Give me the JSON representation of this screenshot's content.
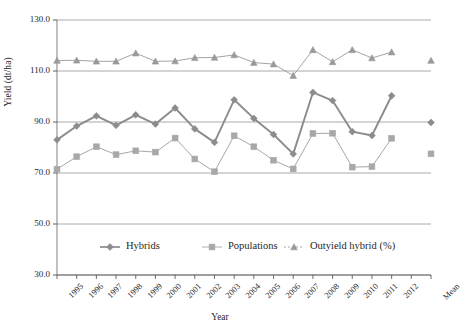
{
  "chart_data": {
    "type": "line",
    "title": "",
    "xlabel": "Year",
    "ylabel": "Yield (dt/ha)",
    "ylim": [
      30.0,
      130.0
    ],
    "ytick_labels": [
      "130.0",
      "110.0",
      "90.0",
      "70.0",
      "50.0",
      "30.0"
    ],
    "ytick_values": [
      130.0,
      110.0,
      90.0,
      70.0,
      50.0,
      30.0
    ],
    "grid": true,
    "legend_position": "bottom-inside",
    "categories": [
      "1995",
      "1996",
      "1997",
      "1998",
      "1999",
      "2000",
      "2001",
      "2002",
      "2003",
      "2004",
      "2005",
      "2006",
      "2007",
      "2008",
      "2009",
      "2010",
      "2011",
      "2012",
      "",
      "Mean"
    ],
    "series": [
      {
        "name": "Hybrids",
        "marker": "diamond",
        "color": "#8c8c8c",
        "values": [
          83.0,
          88.4,
          92.4,
          88.7,
          92.8,
          89.2,
          95.5,
          87.3,
          82.0,
          98.7,
          91.4,
          85.1,
          77.5,
          101.6,
          98.4,
          86.2,
          84.7,
          100.3,
          null,
          89.8
        ]
      },
      {
        "name": "Populations",
        "marker": "square",
        "color": "#a8a8a8",
        "values": [
          71.5,
          76.4,
          80.3,
          77.2,
          78.7,
          78.2,
          83.7,
          75.5,
          70.5,
          84.6,
          80.3,
          75.0,
          71.6,
          85.5,
          85.6,
          72.3,
          72.5,
          83.6,
          null,
          77.5
        ]
      },
      {
        "name": "Outyield hybrid (%)",
        "marker": "triangle",
        "color": "#9a9a9a",
        "values": [
          114.1,
          114.2,
          113.8,
          113.8,
          117.0,
          113.8,
          113.9,
          115.2,
          115.3,
          116.3,
          113.3,
          112.7,
          108.2,
          118.3,
          113.6,
          118.3,
          115.1,
          117.4,
          null,
          114.1
        ]
      }
    ]
  },
  "legend": {
    "items": [
      {
        "label": "Hybrids",
        "marker": "diamond",
        "color": "#8c8c8c"
      },
      {
        "label": "Populations",
        "marker": "square",
        "color": "#a8a8a8"
      },
      {
        "label": "Outyield hybrid (%)",
        "marker": "triangle",
        "color": "#9a9a9a"
      }
    ]
  }
}
